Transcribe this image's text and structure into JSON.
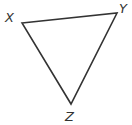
{
  "diagram": {
    "type": "triangle",
    "vertices": [
      {
        "name": "X",
        "x": 22,
        "y": 23,
        "label_x": 5,
        "label_y": 22
      },
      {
        "name": "Y",
        "x": 117,
        "y": 13,
        "label_x": 119,
        "label_y": 13
      },
      {
        "name": "Z",
        "x": 71,
        "y": 104,
        "label_x": 65,
        "label_y": 121
      }
    ],
    "stroke_color": "#333333",
    "background": "#ffffff"
  }
}
